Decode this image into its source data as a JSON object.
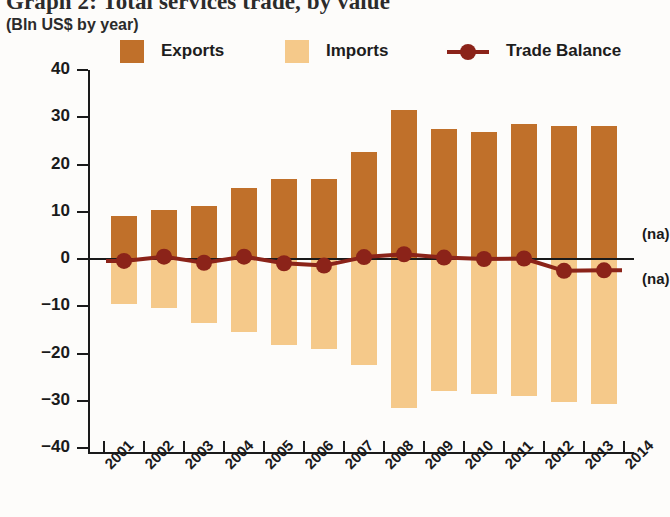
{
  "header": {
    "title": "Graph 2: Total services trade, by value",
    "subtitle": "(Bln US$ by year)"
  },
  "legend": [
    {
      "label": "Exports",
      "marker": "square-swatch",
      "color": "#C0702A"
    },
    {
      "label": "Imports",
      "marker": "square-swatch",
      "color": "#F5C98A"
    },
    {
      "label": "Trade Balance",
      "marker": "line-dot",
      "color": "#8B2319"
    }
  ],
  "annotations": [
    {
      "text": "(na)",
      "value": 5
    },
    {
      "text": "(na)",
      "value": -4.5
    }
  ],
  "chart_data": {
    "type": "bar",
    "title": "Graph 2: Total services trade, by value",
    "subtitle": "(Bln US$ by year)",
    "xlabel": "",
    "ylabel": "Bln US$ by year",
    "ylim": [
      -40,
      40
    ],
    "ytick_step": 10,
    "yticks": [
      40,
      30,
      20,
      10,
      0,
      -10,
      -20,
      -30,
      -40
    ],
    "grid": false,
    "legend_position": "top",
    "categories": [
      "2001",
      "2002",
      "2003",
      "2004",
      "2005",
      "2006",
      "2007",
      "2008",
      "2009",
      "2010",
      "2011",
      "2012",
      "2013"
    ],
    "xtick_labels": [
      "2001",
      "2002",
      "2003",
      "2004",
      "2005",
      "2006",
      "2007",
      "2008",
      "2009",
      "2010",
      "2011",
      "2012",
      "2013",
      "2014"
    ],
    "series": [
      {
        "name": "Exports",
        "type": "bar",
        "color": "#C0702A",
        "values": [
          9.2,
          10.3,
          11.3,
          15.0,
          17.0,
          17.0,
          22.7,
          31.5,
          27.5,
          26.8,
          28.5,
          28.2,
          28.2
        ]
      },
      {
        "name": "Imports",
        "type": "bar",
        "color": "#F5C98A",
        "values": [
          -9.6,
          -10.3,
          -13.5,
          -15.5,
          -18.2,
          -19.0,
          -22.4,
          -31.5,
          -28.0,
          -28.5,
          -29.0,
          -30.2,
          -30.6
        ]
      },
      {
        "name": "Trade Balance",
        "type": "line",
        "color": "#8B2319",
        "values": [
          -0.4,
          0.5,
          -0.8,
          0.5,
          -0.9,
          -1.4,
          0.4,
          1.0,
          0.3,
          0.0,
          0.1,
          -2.5,
          -2.4
        ]
      }
    ]
  }
}
